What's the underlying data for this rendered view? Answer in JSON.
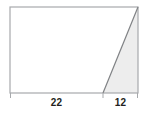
{
  "figure": {
    "kind": "geometry-diagram",
    "canvas": {
      "width": 149,
      "height": 118
    },
    "colors": {
      "background": "#ffffff",
      "outline": "#a7a9ac",
      "diagonal": "#808285",
      "shaded_fill": "#ededed",
      "label_text": "#231f20"
    },
    "rectangle": {
      "name": "outer-rectangle",
      "x": 10,
      "y": 7,
      "width": 128,
      "height": 86,
      "fill": "#ffffff",
      "stroke": "#a7a9ac",
      "stroke_width": 1.2
    },
    "diagonal": {
      "name": "diagonal-line",
      "from": {
        "x": 103,
        "y": 93
      },
      "to": {
        "x": 138,
        "y": 7
      },
      "stroke": "#808285",
      "stroke_width": 1.2
    },
    "shaded_triangle": {
      "name": "shaded-triangle",
      "points": "103,93 138,93 138,7",
      "fill": "#ededed"
    },
    "ticks": [
      {
        "name": "tick-left",
        "x": 10,
        "y1": 93,
        "y2": 98
      },
      {
        "name": "tick-middle",
        "x": 103,
        "y1": 93,
        "y2": 98
      },
      {
        "name": "tick-right",
        "x": 138,
        "y1": 93,
        "y2": 98
      }
    ],
    "labels": {
      "base_left": "22",
      "base_right": "12"
    }
  }
}
